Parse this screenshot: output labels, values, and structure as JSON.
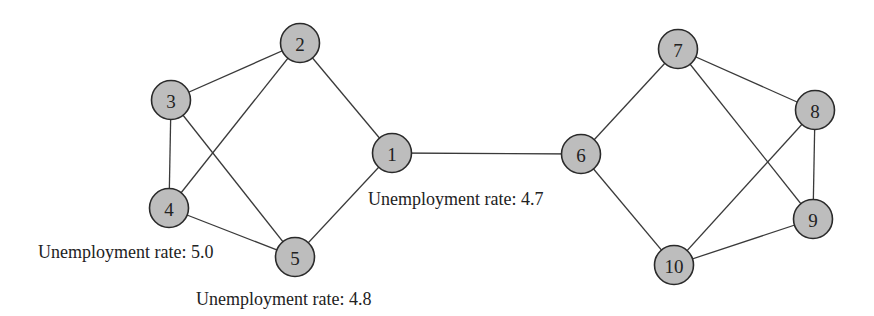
{
  "diagram": {
    "type": "network-graph",
    "nodes": [
      {
        "id": "1",
        "label": "1",
        "x": 392,
        "y": 153
      },
      {
        "id": "2",
        "label": "2",
        "x": 300,
        "y": 43
      },
      {
        "id": "3",
        "label": "3",
        "x": 171,
        "y": 100
      },
      {
        "id": "4",
        "label": "4",
        "x": 169,
        "y": 208
      },
      {
        "id": "5",
        "label": "5",
        "x": 295,
        "y": 257
      },
      {
        "id": "6",
        "label": "6",
        "x": 581,
        "y": 154
      },
      {
        "id": "7",
        "label": "7",
        "x": 678,
        "y": 49
      },
      {
        "id": "8",
        "label": "8",
        "x": 815,
        "y": 110
      },
      {
        "id": "9",
        "label": "9",
        "x": 813,
        "y": 219
      },
      {
        "id": "10",
        "label": "10",
        "x": 674,
        "y": 265
      }
    ],
    "edges": [
      [
        "2",
        "3"
      ],
      [
        "2",
        "4"
      ],
      [
        "2",
        "1"
      ],
      [
        "3",
        "4"
      ],
      [
        "3",
        "5"
      ],
      [
        "4",
        "5"
      ],
      [
        "5",
        "1"
      ],
      [
        "1",
        "6"
      ],
      [
        "6",
        "7"
      ],
      [
        "6",
        "10"
      ],
      [
        "7",
        "8"
      ],
      [
        "7",
        "9"
      ],
      [
        "8",
        "9"
      ],
      [
        "8",
        "10"
      ],
      [
        "9",
        "10"
      ]
    ],
    "annotations": [
      {
        "text": "Unemployment rate: 4.7",
        "x": 368,
        "y": 205,
        "node": "1"
      },
      {
        "text": "Unemployment rate: 5.0",
        "x": 38,
        "y": 258,
        "node": "4"
      },
      {
        "text": "Unemployment rate: 4.8",
        "x": 196,
        "y": 305,
        "node": "5"
      }
    ],
    "colors": {
      "node_fill": "#bdbdbd",
      "node_stroke": "#2a2a2a",
      "edge": "#3a3a3a"
    }
  }
}
